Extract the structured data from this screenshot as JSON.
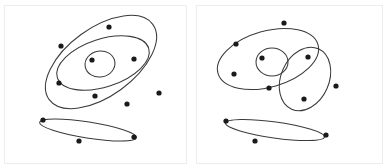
{
  "figure": {
    "title": "",
    "background_color": "#ffffff",
    "width": 388,
    "height": 168,
    "panel_count": 2,
    "frame_color": "#ededed",
    "curve_color": "#3a3a3a",
    "point_color": "#1a1a1a",
    "point_radius": 2.6,
    "curve_stroke_width": 1.05
  },
  "chart_data": {
    "type": "scatter",
    "title": "",
    "subtitle": "",
    "xlabel": "",
    "ylabel": "",
    "grid": false,
    "legend": null,
    "panels": [
      {
        "name": "left-panel",
        "label": "",
        "frame": {
          "x": 4,
          "y": 5,
          "width": 183,
          "height": 159
        },
        "ellipses": [
          {
            "name": "outer-ellipse",
            "cx": 101,
            "cy": 62,
            "rx": 64,
            "ry": 34,
            "rotation": -36
          },
          {
            "name": "middle-ellipse",
            "cx": 103,
            "cy": 63,
            "rx": 48,
            "ry": 24,
            "rotation": -18
          },
          {
            "name": "inner-circle",
            "cx": 100,
            "cy": 64,
            "rx": 15,
            "ry": 13,
            "rotation": -10
          },
          {
            "name": "thin-ellipse",
            "cx": 88,
            "cy": 130,
            "rx": 49,
            "ry": 8,
            "rotation": 9
          }
        ],
        "points": [
          {
            "x": 109,
            "y": 27
          },
          {
            "x": 61,
            "y": 46
          },
          {
            "x": 92,
            "y": 60
          },
          {
            "x": 134,
            "y": 59
          },
          {
            "x": 59,
            "y": 83
          },
          {
            "x": 95,
            "y": 96
          },
          {
            "x": 127,
            "y": 104
          },
          {
            "x": 159,
            "y": 93
          },
          {
            "x": 43,
            "y": 120
          },
          {
            "x": 134,
            "y": 137
          },
          {
            "x": 79,
            "y": 141
          }
        ]
      },
      {
        "name": "right-panel",
        "label": "",
        "frame": {
          "x": 196,
          "y": 5,
          "width": 187,
          "height": 159
        },
        "ellipses": [
          {
            "name": "large-ellipse",
            "cx": 268,
            "cy": 59,
            "rx": 52,
            "ry": 28,
            "rotation": -16
          },
          {
            "name": "right-ellipse",
            "cx": 305,
            "cy": 79,
            "rx": 24,
            "ry": 33,
            "rotation": 24
          },
          {
            "name": "inner-circle",
            "cx": 272,
            "cy": 62,
            "rx": 16,
            "ry": 14,
            "rotation": 0
          },
          {
            "name": "thin-ellipse",
            "cx": 275,
            "cy": 130,
            "rx": 50,
            "ry": 8,
            "rotation": 8
          }
        ],
        "points": [
          {
            "x": 284,
            "y": 23
          },
          {
            "x": 236,
            "y": 44
          },
          {
            "x": 262,
            "y": 58
          },
          {
            "x": 308,
            "y": 57
          },
          {
            "x": 234,
            "y": 74
          },
          {
            "x": 269,
            "y": 88
          },
          {
            "x": 336,
            "y": 86
          },
          {
            "x": 304,
            "y": 99
          },
          {
            "x": 226,
            "y": 121
          },
          {
            "x": 326,
            "y": 135
          },
          {
            "x": 255,
            "y": 141
          }
        ]
      }
    ]
  }
}
